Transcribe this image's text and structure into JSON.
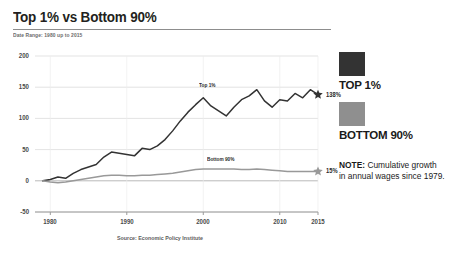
{
  "header": {
    "title": "Top 1% vs Bottom 90%",
    "subtitle": "Date Range: 1980 up to 2015"
  },
  "legend": {
    "items": [
      {
        "label": "TOP 1%",
        "color": "#333333"
      },
      {
        "label": "BOTTOM 90%",
        "color": "#8f8f8f"
      }
    ]
  },
  "note": {
    "prefix": "NOTE:",
    "text": " Cumulative growth in annual wages since 1979."
  },
  "chart_data": {
    "type": "line",
    "title": "Top 1% vs Bottom 90%",
    "subtitle": "Date Range: 1980 up to 2015",
    "xlabel": "",
    "ylabel": "",
    "xlim": [
      1978,
      2015
    ],
    "ylim": [
      -50,
      200
    ],
    "yticks": [
      200,
      150,
      100,
      50,
      0,
      -50
    ],
    "xticks": [
      1980,
      1990,
      2000,
      2010,
      2015
    ],
    "grid": true,
    "legend_position": "right",
    "source": "Source: Economic Policy Institute",
    "annotations": [
      {
        "text": "Top 1%",
        "series": "TOP 1%",
        "x": 2001,
        "y": 150
      },
      {
        "text": "Bottom 90%",
        "series": "BOTTOM 90%",
        "x": 2002,
        "y": 32
      },
      {
        "text": "138%",
        "series": "TOP 1%",
        "x": 2015,
        "y": 138,
        "marker": "star"
      },
      {
        "text": "15%",
        "series": "BOTTOM 90%",
        "x": 2015,
        "y": 15,
        "marker": "star"
      }
    ],
    "x": [
      1979,
      1980,
      1981,
      1982,
      1983,
      1984,
      1985,
      1986,
      1987,
      1988,
      1989,
      1990,
      1991,
      1992,
      1993,
      1994,
      1995,
      1996,
      1997,
      1998,
      1999,
      2000,
      2001,
      2002,
      2003,
      2004,
      2005,
      2006,
      2007,
      2008,
      2009,
      2010,
      2011,
      2012,
      2013,
      2014,
      2015
    ],
    "series": [
      {
        "name": "TOP 1%",
        "color": "#333333",
        "end_value": 138,
        "end_label": "138%",
        "values": [
          0,
          2,
          6,
          4,
          12,
          18,
          22,
          26,
          38,
          46,
          44,
          42,
          40,
          52,
          50,
          56,
          66,
          80,
          96,
          110,
          122,
          133,
          120,
          112,
          104,
          118,
          130,
          136,
          146,
          128,
          118,
          130,
          128,
          140,
          133,
          146,
          138
        ]
      },
      {
        "name": "BOTTOM 90%",
        "color": "#999999",
        "end_value": 15,
        "end_label": "15%",
        "values": [
          0,
          -2,
          -3,
          -2,
          0,
          2,
          4,
          6,
          8,
          9,
          9,
          8,
          8,
          9,
          9,
          10,
          11,
          12,
          14,
          16,
          18,
          19,
          19,
          19,
          19,
          19,
          18,
          18,
          19,
          18,
          17,
          16,
          15,
          15,
          15,
          15,
          15
        ]
      }
    ]
  }
}
